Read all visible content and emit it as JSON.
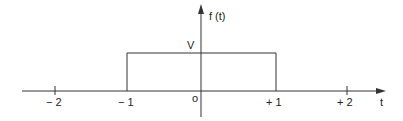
{
  "diagram": {
    "y_axis_label": "f (t)",
    "x_axis_label": "t",
    "amplitude_label": "V",
    "origin_label": "o",
    "ticks": [
      {
        "label": "− 2",
        "value": -2
      },
      {
        "label": "− 1",
        "value": -1
      },
      {
        "label": "+ 1",
        "value": 1
      },
      {
        "label": "+ 2",
        "value": 2
      }
    ],
    "pulse": {
      "start": -1,
      "end": 1,
      "amplitude": "V"
    },
    "colors": {
      "line": "#333333",
      "text": "#222222"
    }
  }
}
